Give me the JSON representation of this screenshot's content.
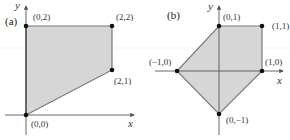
{
  "colors": {
    "fill": "#d6d6d6",
    "edge": "#7a7a7a",
    "axis": "#555555",
    "point": "#111111"
  },
  "panels": [
    {
      "label": "(a)",
      "axis_x": "x",
      "axis_y": "y",
      "vertices": [
        {
          "coord": "(0,2)"
        },
        {
          "coord": "(2,2)"
        },
        {
          "coord": "(2,1)"
        },
        {
          "coord": "(0,0)"
        }
      ]
    },
    {
      "label": "(b)",
      "axis_x": "x",
      "axis_y": "y",
      "vertices": [
        {
          "coord": "(0,1)"
        },
        {
          "coord": "(1,1)"
        },
        {
          "coord": "(1,0)"
        },
        {
          "coord": "(0,−1)"
        },
        {
          "coord": "(−1,0)"
        }
      ]
    }
  ]
}
